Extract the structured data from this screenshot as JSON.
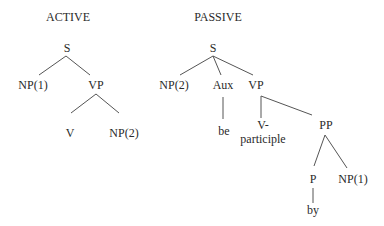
{
  "diagram": {
    "type": "syntax-tree-comparison",
    "colors": {
      "text": "#2a2a2a",
      "edge": "#555555",
      "background": "#ffffff"
    },
    "active": {
      "title": "ACTIVE",
      "nodes": {
        "s": "S",
        "np1": "NP(1)",
        "vp": "VP",
        "v": "V",
        "np2": "NP(2)"
      },
      "edges": [
        [
          "S",
          "NP(1)"
        ],
        [
          "S",
          "VP"
        ],
        [
          "VP",
          "V"
        ],
        [
          "VP",
          "NP(2)"
        ]
      ]
    },
    "passive": {
      "title": "PASSIVE",
      "nodes": {
        "s": "S",
        "np2": "NP(2)",
        "aux": "Aux",
        "vp": "VP",
        "be": "be",
        "v_line1": "V-",
        "v_line2": "participle",
        "pp": "PP",
        "p": "P",
        "np1": "NP(1)",
        "by": "by"
      },
      "edges": [
        [
          "S",
          "NP(2)"
        ],
        [
          "S",
          "Aux"
        ],
        [
          "S",
          "VP"
        ],
        [
          "Aux",
          "be"
        ],
        [
          "VP",
          "V-participle"
        ],
        [
          "VP",
          "PP"
        ],
        [
          "PP",
          "P"
        ],
        [
          "PP",
          "NP(1)"
        ],
        [
          "P",
          "by"
        ]
      ]
    }
  }
}
